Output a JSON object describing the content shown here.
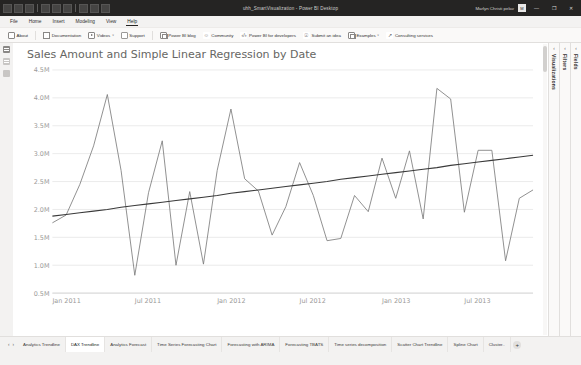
{
  "window": {
    "title": "uhh_SmartVisualization - Power BI Desktop",
    "account": "Marlyn Christi pelav",
    "account_initials": "M",
    "minimize": "—",
    "restore": "❐",
    "close": "✕",
    "quick_access_icons": [
      "save-icon",
      "undo-icon",
      "redo-icon"
    ]
  },
  "menubar": {
    "items": [
      {
        "label": "File",
        "active": false
      },
      {
        "label": "Home",
        "active": false
      },
      {
        "label": "Insert",
        "active": false
      },
      {
        "label": "Modeling",
        "active": false
      },
      {
        "label": "View",
        "active": false
      },
      {
        "label": "Help",
        "active": true
      }
    ]
  },
  "ribbon": {
    "items": [
      {
        "label": "About",
        "icon": "info-icon",
        "caret": ""
      },
      {
        "label": "Documentation",
        "icon": "book-icon",
        "caret": ""
      },
      {
        "label": "Videos",
        "icon": "video-icon",
        "caret": "∨"
      },
      {
        "label": "Support",
        "icon": "lifebuoy-icon",
        "caret": ""
      },
      {
        "label": "Power BI blog",
        "icon": "blog-icon",
        "caret": ""
      },
      {
        "label": "Community",
        "icon": "community-icon",
        "caret": ""
      },
      {
        "label": "Power BI for developers",
        "icon": "code-icon",
        "caret": ""
      },
      {
        "label": "Submit an idea",
        "icon": "lightbulb-idea-icon",
        "caret": ""
      },
      {
        "label": "Examples",
        "icon": "examples-icon",
        "caret": "∨"
      },
      {
        "label": "Consulting services",
        "icon": "consulting-icon",
        "caret": ""
      }
    ]
  },
  "left_rail": {
    "items": [
      {
        "name": "report-view-icon",
        "active": true
      },
      {
        "name": "data-view-icon",
        "active": false
      },
      {
        "name": "model-view-icon",
        "active": false
      }
    ]
  },
  "right_panes": [
    {
      "label": "Visualizations",
      "caret": "‹"
    },
    {
      "label": "Filters",
      "caret": "‹"
    },
    {
      "label": "Fields",
      "caret": "‹"
    }
  ],
  "tabbar": {
    "nav_prev": "‹",
    "nav_next": "›",
    "add_label": "+",
    "tabs": [
      {
        "label": "Analytics Trendline",
        "active": false
      },
      {
        "label": "DAX Trendline",
        "active": true
      },
      {
        "label": "Analytics Forecast",
        "active": false
      },
      {
        "label": "Time Series Forecasting Chart",
        "active": false
      },
      {
        "label": "Forecasting with ARIMA",
        "active": false
      },
      {
        "label": "Forecasting TBATS",
        "active": false
      },
      {
        "label": "Time series decomposition",
        "active": false
      },
      {
        "label": "Scatter Chart Trendline",
        "active": false
      },
      {
        "label": "Spline Chart",
        "active": false
      },
      {
        "label": "Cluster..",
        "active": false
      }
    ]
  },
  "chart_data": {
    "type": "line",
    "title": "Sales Amount and Simple Linear Regression by Date",
    "xlabel": "",
    "ylabel": "",
    "grid": true,
    "legend_position": "none",
    "ylim": [
      500000,
      4500000
    ],
    "ytick_labels": [
      "0.5M",
      "1.0M",
      "1.5M",
      "2.0M",
      "2.5M",
      "3.0M",
      "3.5M",
      "4.0M",
      "4.5M"
    ],
    "yticks": [
      500000,
      1000000,
      1500000,
      2000000,
      2500000,
      3000000,
      3500000,
      4000000,
      4500000
    ],
    "xtick_labels": [
      "Jan 2011",
      "Jul 2011",
      "Jan 2012",
      "Jul 2012",
      "Jan 2013",
      "Jul 2013"
    ],
    "xticks": [
      "2011-01",
      "2011-07",
      "2012-01",
      "2012-07",
      "2013-01",
      "2013-07"
    ],
    "x": [
      "2011-01",
      "2011-02",
      "2011-03",
      "2011-04",
      "2011-05",
      "2011-06",
      "2011-07",
      "2011-08",
      "2011-09",
      "2011-10",
      "2011-11",
      "2011-12",
      "2012-01",
      "2012-02",
      "2012-03",
      "2012-04",
      "2012-05",
      "2012-06",
      "2012-07",
      "2012-08",
      "2012-09",
      "2012-10",
      "2012-11",
      "2012-12",
      "2013-01",
      "2013-02",
      "2013-03",
      "2013-04",
      "2013-05",
      "2013-06",
      "2013-07",
      "2013-08",
      "2013-09",
      "2013-10",
      "2013-11",
      "2013-12"
    ],
    "series": [
      {
        "name": "Sales Amount",
        "color": "#7b7b7b",
        "values": [
          1760000,
          1900000,
          2450000,
          3140000,
          4060000,
          2700000,
          820000,
          2300000,
          3230000,
          1000000,
          2320000,
          1020000,
          2700000,
          3800000,
          2550000,
          2330000,
          1540000,
          2050000,
          2840000,
          2250000,
          1440000,
          1480000,
          2250000,
          1960000,
          2920000,
          2200000,
          3050000,
          1830000,
          4170000,
          3980000,
          1950000,
          3060000,
          3060000,
          1080000,
          2200000,
          2350000
        ]
      },
      {
        "name": "Simple Linear Regression",
        "color": "#3a3a3a",
        "values": [
          1880000,
          1910000,
          1940000,
          1970000,
          2000000,
          2040000,
          2070000,
          2100000,
          2130000,
          2160000,
          2190000,
          2220000,
          2250000,
          2290000,
          2320000,
          2350000,
          2380000,
          2410000,
          2440000,
          2470000,
          2500000,
          2540000,
          2570000,
          2600000,
          2630000,
          2660000,
          2690000,
          2720000,
          2750000,
          2790000,
          2820000,
          2850000,
          2880000,
          2910000,
          2940000,
          2970000
        ]
      }
    ]
  }
}
